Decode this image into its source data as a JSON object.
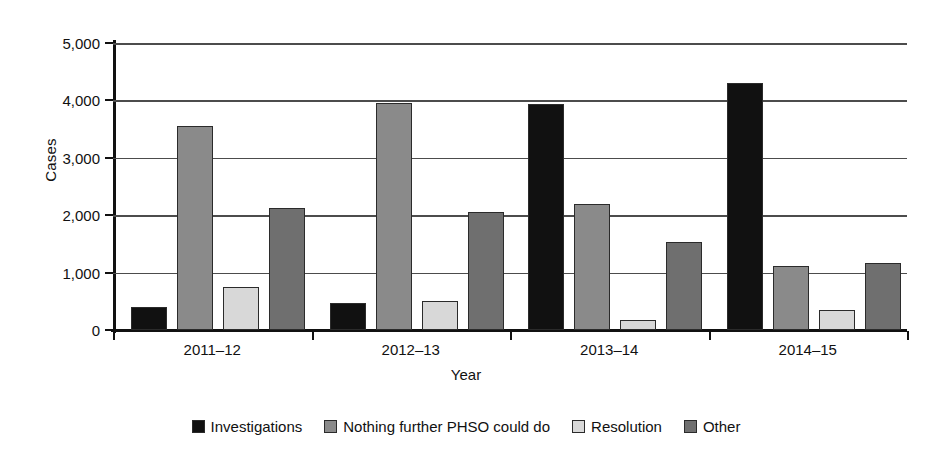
{
  "chart_data": {
    "type": "bar",
    "title": "",
    "xlabel": "Year",
    "ylabel": "Cases",
    "categories": [
      "2011–12",
      "2012–13",
      "2013–14",
      "2014–15"
    ],
    "series": [
      {
        "name": "Investigations",
        "color": "#111111",
        "values": [
          400,
          470,
          3930,
          4300
        ]
      },
      {
        "name": "Nothing further PHSO could do",
        "color": "#8a8a8a",
        "values": [
          3550,
          3960,
          2190,
          1110
        ]
      },
      {
        "name": "Resolution",
        "color": "#d8d8d8",
        "values": [
          750,
          510,
          180,
          340
        ]
      },
      {
        "name": "Other",
        "color": "#6f6f6f",
        "values": [
          2130,
          2050,
          1540,
          1160
        ]
      }
    ],
    "ylim": [
      0,
      5000
    ],
    "yticks": [
      0,
      1000,
      2000,
      3000,
      4000,
      5000
    ],
    "ytick_labels": [
      "0",
      "1,000",
      "2,000",
      "3,000",
      "4,000",
      "5,000"
    ],
    "grid": true,
    "legend_position": "bottom"
  },
  "legend": {
    "items": [
      {
        "label": "Investigations"
      },
      {
        "label": "Nothing further PHSO could do"
      },
      {
        "label": "Resolution"
      },
      {
        "label": "Other"
      }
    ]
  }
}
